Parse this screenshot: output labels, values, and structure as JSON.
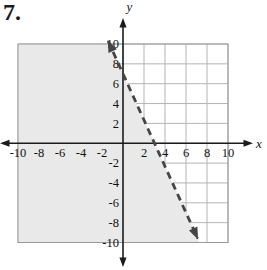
{
  "problem": {
    "number": "7."
  },
  "chart_data": {
    "type": "line",
    "title": "",
    "xlabel": "x",
    "ylabel": "y",
    "xlim": [
      -10,
      10
    ],
    "ylim": [
      -10,
      10
    ],
    "grid": true,
    "grid_step": 2,
    "x_ticks": [
      -10,
      -8,
      -6,
      -4,
      -2,
      2,
      4,
      6,
      8,
      10
    ],
    "y_ticks": [
      -10,
      -8,
      -6,
      -4,
      -2,
      2,
      4,
      6,
      8,
      10
    ],
    "series": [
      {
        "name": "boundary-line",
        "style": "dashed",
        "arrows": "both-ends",
        "x_intercept": 3,
        "y_intercept": 7,
        "slope": -2.3333,
        "points": [
          [
            0,
            7
          ],
          [
            3,
            0
          ]
        ],
        "equation": "y = -(7/3)x + 7"
      }
    ],
    "shaded_region": {
      "side": "left-of-line",
      "description": "Region to the left of / below the dashed boundary line, clipped to the grid square from -10 to 10 on both axes"
    },
    "colors": {
      "shade": "#e9e9e9",
      "grid": "#b4b4b4",
      "border": "#999999",
      "axis": "#1b1b1b",
      "line": "#454545",
      "text": "#111111"
    }
  }
}
